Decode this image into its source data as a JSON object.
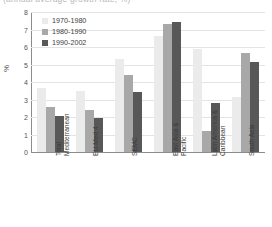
{
  "title_ghost": "(annual average growth rate, %)",
  "chart_data": {
    "type": "bar",
    "title": "",
    "xlabel": "",
    "ylabel": "%",
    "ylim": [
      0,
      8
    ],
    "ytick_labels": [
      "0",
      "1",
      "2",
      "3",
      "4",
      "5",
      "6",
      "7",
      "8"
    ],
    "grid": true,
    "legend_position": "top-left-inside",
    "categories": [
      "Total Mediterranean",
      "EU-Med 4",
      "SEMC",
      "East Asia & Pacific",
      "Latin America & Caribbean",
      "South Asia"
    ],
    "category_lines": [
      [
        "Total",
        "Mediterranean"
      ],
      [
        "EU-Med 4",
        ""
      ],
      [
        "SEMC",
        ""
      ],
      [
        "East Asia &",
        "Pacific"
      ],
      [
        "Latin America &",
        "Caribbean"
      ],
      [
        "South Asia",
        ""
      ]
    ],
    "series": [
      {
        "name": "1970-1980",
        "color": "#ebebeb",
        "values": [
          3.65,
          3.5,
          5.3,
          6.65,
          5.9,
          3.15
        ]
      },
      {
        "name": "1980-1990",
        "color": "#a8a8a8",
        "values": [
          2.55,
          2.4,
          4.4,
          7.3,
          1.2,
          5.65
        ]
      },
      {
        "name": "1990-2002",
        "color": "#585858",
        "values": [
          2.05,
          1.95,
          3.45,
          7.45,
          2.8,
          5.15
        ]
      }
    ]
  }
}
